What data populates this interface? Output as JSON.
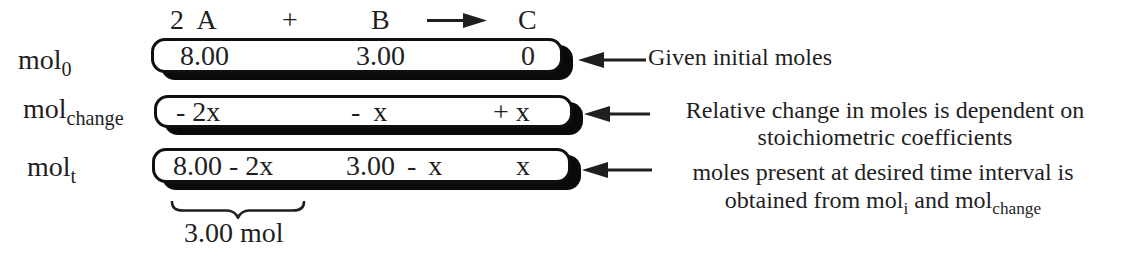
{
  "equation": {
    "term_a": "2 A",
    "plus": "+",
    "term_b": "B",
    "term_c": "C"
  },
  "rows": [
    {
      "label_base": "mol",
      "label_sub": "0",
      "cells": [
        "8.00",
        "3.00",
        "0"
      ]
    },
    {
      "label_base": "mol",
      "label_sub": "change",
      "cells": [
        "- 2x",
        "- x",
        "+ x"
      ]
    },
    {
      "label_base": "mol",
      "label_sub": "t",
      "cells": [
        "8.00 - 2x",
        "3.00 - x",
        "x"
      ]
    }
  ],
  "annotations": [
    {
      "line1": "Given initial moles"
    },
    {
      "line1": "Relative change in moles is dependent on",
      "line2": "stoichiometric coefficients"
    },
    {
      "line1": "moles present at desired time interval is",
      "line2_t1": "obtained from mol",
      "line2_s1": "i",
      "line2_t2": " and mol",
      "line2_s2": "change"
    }
  ],
  "brace_label": "3.00 mol",
  "colors": {
    "ink": "#1f1f1f",
    "box_border": "#101010",
    "box_shadow": "#0a0a0a",
    "background": "#ffffff"
  }
}
